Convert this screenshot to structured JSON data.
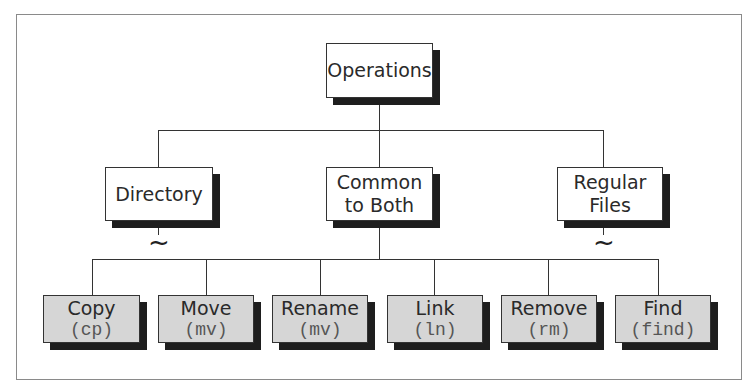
{
  "diagram": {
    "root": {
      "label": "Operations"
    },
    "categories": [
      {
        "label": "Directory"
      },
      {
        "label": "Common to Both"
      },
      {
        "label": "Regular Files"
      }
    ],
    "category_lines": [
      "Common",
      "to Both",
      "Regular",
      "Files"
    ],
    "operations": [
      {
        "label": "Copy",
        "command": "(cp)"
      },
      {
        "label": "Move",
        "command": "(mv)"
      },
      {
        "label": "Rename",
        "command": "(mv)"
      },
      {
        "label": "Link",
        "command": "(ln)"
      },
      {
        "label": "Remove",
        "command": "(rm)"
      },
      {
        "label": "Find",
        "command": "(find)"
      }
    ],
    "tilde_symbol": "~",
    "colors": {
      "leaf_fill": "#d6d6d6",
      "node_fill": "#ffffff",
      "shadow": "#1e1e1e",
      "frame": "#8a8a8a"
    }
  }
}
